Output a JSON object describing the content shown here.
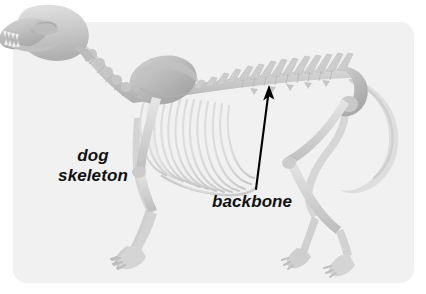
{
  "figure": {
    "subject": "dog skeleton",
    "width": 426,
    "height": 294,
    "page_background": "#ffffff",
    "panel": {
      "name": "illustration-panel",
      "fill": "#f1f1f1",
      "x": 13,
      "y": 22,
      "width": 401,
      "height": 261,
      "corner_radius": 14
    }
  },
  "labels": {
    "skeleton": {
      "line1": "dog",
      "line2": "skeleton",
      "x": 93,
      "y": 166,
      "style": "italic",
      "color": "#111111"
    },
    "backbone": {
      "text": "backbone",
      "x": 255,
      "y": 201,
      "style": "italic",
      "color": "#111111"
    }
  },
  "annotations": {
    "arrow": {
      "name": "backbone-pointer-arrow",
      "color": "#000000",
      "tail_x": 256,
      "tail_y": 189,
      "tip_x": 269,
      "tip_y": 86,
      "points_to": "backbone"
    }
  },
  "illustration": {
    "name": "dog-skeleton-illustration",
    "rendering": "grayscale photographic skeleton",
    "bone_light": "#e2e2e2",
    "bone_mid": "#cccccc",
    "bone_dark": "#aaaaaa",
    "bone_shadow": "#9a9a9a",
    "parts": [
      "skull",
      "mandible",
      "teeth",
      "cervical-vertebrae",
      "scapula",
      "thoracic-vertebrae",
      "lumbar-vertebrae",
      "ribcage",
      "sternum",
      "pelvis",
      "tail",
      "front-legs",
      "front-paws",
      "hind-legs",
      "hind-paws"
    ],
    "rib_count": 13,
    "vertebral_spine_count": 14,
    "orientation": "left-facing profile view"
  }
}
